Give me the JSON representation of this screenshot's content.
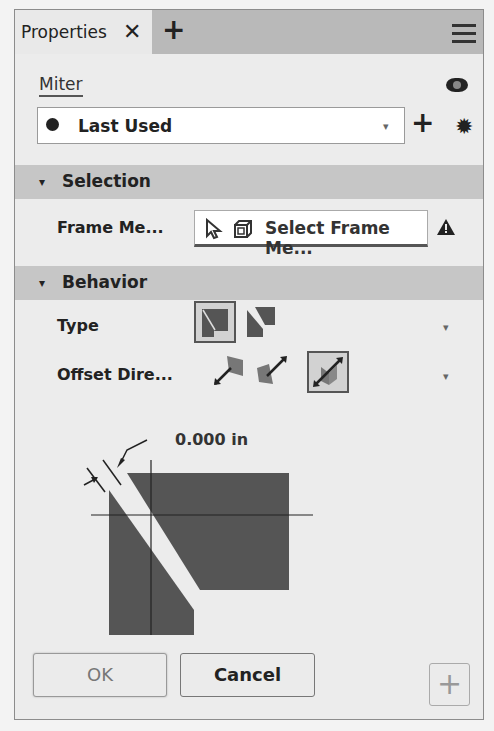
{
  "tabbar": {
    "active_tab": "Properties",
    "close_glyph": "✕",
    "add_glyph": "+",
    "menu_icon": "hamburger-icon"
  },
  "header": {
    "feature_name": "Miter",
    "visibility_icon": "eye-icon"
  },
  "preset": {
    "icon": "clock-icon",
    "value": "Last Used",
    "caret": "▾",
    "add_glyph": "+",
    "settings_icon": "gear-icon",
    "settings_glyph": "✹"
  },
  "sections": {
    "selection": {
      "title": "Selection",
      "toggle": "▾",
      "rows": [
        {
          "label": "Frame Me...",
          "select_text": "Select Frame Me...",
          "status": "warning"
        }
      ]
    },
    "behavior": {
      "title": "Behavior",
      "toggle": "▾",
      "rows": [
        {
          "label": "Type",
          "options": [
            "miter-full",
            "miter-split"
          ],
          "selected": 0,
          "caret": "▾"
        },
        {
          "label": "Offset Dire...",
          "options": [
            "direction-1",
            "direction-2",
            "symmetric"
          ],
          "selected": 2,
          "caret": "▾"
        }
      ]
    }
  },
  "preview": {
    "gap_label": "0.000 in"
  },
  "footer": {
    "ok_label": "OK",
    "cancel_label": "Cancel",
    "plus_glyph": "+"
  },
  "colors": {
    "panel_bg": "#ececec",
    "tabbar_bg": "#b9b9b9",
    "section_bg": "#c6c6c6",
    "shape_fill": "#555555"
  }
}
